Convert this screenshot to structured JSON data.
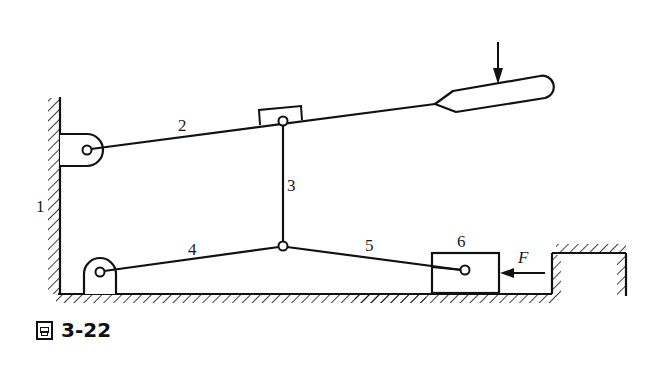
{
  "figure": {
    "caption_glyph": "圖",
    "caption_number": "3-22",
    "labels": {
      "frame": "1",
      "link2": "2",
      "link3": "3",
      "link4": "4",
      "link5": "5",
      "slider6": "6",
      "force": "F"
    },
    "colors": {
      "ink": "#111111",
      "background": "#ffffff"
    }
  }
}
